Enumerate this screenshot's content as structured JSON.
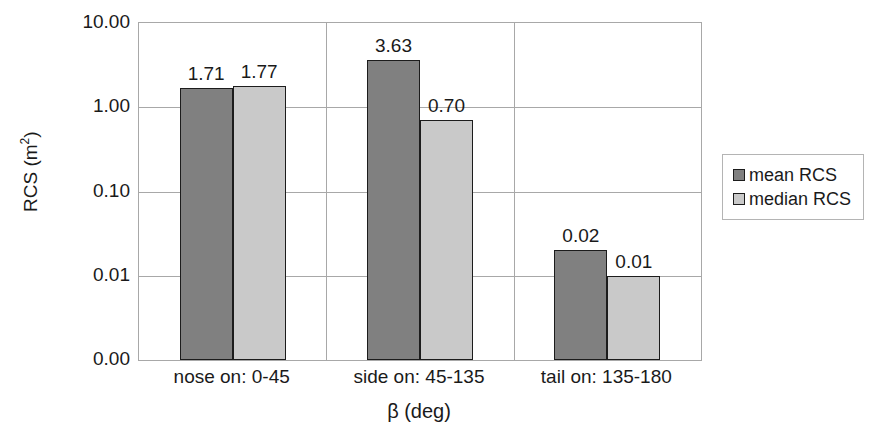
{
  "chart_data": {
    "type": "bar",
    "title": "",
    "subtitle": "",
    "xlabel": "β (deg)",
    "ylabel": "RCS (m",
    "ylabel_sup": "2",
    "ylabel_suffix": ")",
    "ylabel_full": "RCS (m2)",
    "yscale": "log",
    "ylim": [
      0.001,
      10.0
    ],
    "ytick_labels": [
      "10.00",
      "1.00",
      "0.10",
      "0.01",
      "0.00"
    ],
    "ytick_values": [
      10.0,
      1.0,
      0.1,
      0.01,
      0.001
    ],
    "grid": "horizontal-and-category-separators",
    "legend_position": "right",
    "categories": [
      "nose on:  0-45",
      "side on: 45-135",
      "tail on: 135-180"
    ],
    "series": [
      {
        "name": "mean RCS",
        "color": "#808080",
        "values": [
          1.71,
          3.63,
          0.02
        ],
        "labels": [
          "1.71",
          "3.63",
          "0.02"
        ]
      },
      {
        "name": "median RCS",
        "color": "#c9c9c9",
        "values": [
          1.77,
          0.7,
          0.01
        ],
        "labels": [
          "1.77",
          "0.70",
          "0.01"
        ]
      }
    ]
  },
  "legend": {
    "items": [
      {
        "label": "mean RCS",
        "color": "#808080"
      },
      {
        "label": "median RCS",
        "color": "#c9c9c9"
      }
    ]
  },
  "colors": {
    "mean": "#808080",
    "median": "#c9c9c9",
    "gridline": "#a8a8a8",
    "bar_outline": "#1c1c1c",
    "text": "#1a1a1a",
    "background": "#ffffff"
  }
}
